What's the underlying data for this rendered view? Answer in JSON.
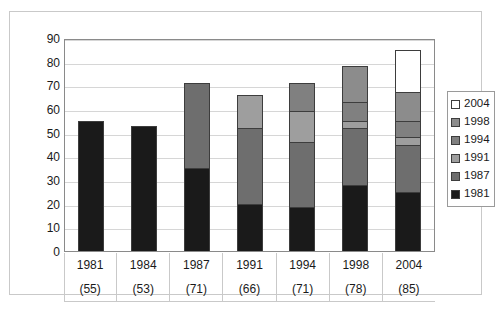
{
  "chart_data": {
    "type": "bar",
    "subtype": "stacked-column",
    "title": "",
    "xlabel": "",
    "ylabel": "",
    "ylim": [
      0,
      90
    ],
    "ytick_step": 10,
    "yticks": [
      90,
      80,
      70,
      60,
      50,
      40,
      30,
      20,
      10,
      0
    ],
    "grid": true,
    "legend_position": "right",
    "categories": [
      "1981",
      "1984",
      "1987",
      "1991",
      "1994",
      "1998",
      "2004"
    ],
    "category_totals": [
      "(55)",
      "(53)",
      "(71)",
      "(66)",
      "(71)",
      "(78)",
      "(85)"
    ],
    "totals": [
      55,
      53,
      71,
      66,
      71,
      78,
      85
    ],
    "series": [
      {
        "name": "1981",
        "color": "#1a1a1a",
        "values": [
          55,
          53,
          35,
          20,
          18.5,
          28,
          25
        ]
      },
      {
        "name": "1987",
        "color": "#6e6e6e",
        "values": [
          0,
          0,
          36,
          32,
          27.5,
          24,
          20
        ]
      },
      {
        "name": "1991",
        "color": "#9e9e9e",
        "values": [
          0,
          0,
          0,
          14,
          13,
          3,
          3
        ]
      },
      {
        "name": "1994",
        "color": "#808080",
        "values": [
          0,
          0,
          0,
          0,
          12,
          8,
          7
        ]
      },
      {
        "name": "1998",
        "color": "#8c8c8c",
        "values": [
          0,
          0,
          0,
          0,
          0,
          15,
          12
        ]
      },
      {
        "name": "2004",
        "color": "#ffffff",
        "values": [
          0,
          0,
          0,
          0,
          0,
          0,
          18
        ]
      }
    ],
    "legend": [
      {
        "label": "2004",
        "color": "#ffffff"
      },
      {
        "label": "1998",
        "color": "#8c8c8c"
      },
      {
        "label": "1994",
        "color": "#808080"
      },
      {
        "label": "1991",
        "color": "#9e9e9e"
      },
      {
        "label": "1987",
        "color": "#6e6e6e"
      },
      {
        "label": "1981",
        "color": "#1a1a1a"
      }
    ]
  }
}
